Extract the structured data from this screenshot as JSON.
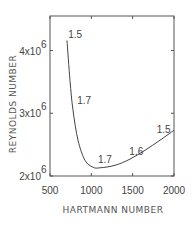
{
  "chart_data": {
    "type": "line",
    "title": "",
    "xlabel": "HARTMANN NUMBER",
    "ylabel": "REYNOLDS NUMBER",
    "xlim": [
      500,
      2000
    ],
    "ylim": [
      2000000,
      4550000
    ],
    "grid": false,
    "legend": null,
    "x_ticks": [
      500,
      1000,
      1500,
      2000
    ],
    "x_tick_labels": [
      "500",
      "1000",
      "1500",
      "2000"
    ],
    "y_ticks": [
      2000000,
      3000000,
      4000000
    ],
    "y_tick_labels": [
      {
        "base": "2x10",
        "exp": "6"
      },
      {
        "base": "3x10",
        "exp": "6"
      },
      {
        "base": "4x10",
        "exp": "6"
      }
    ],
    "series": [
      {
        "name": "critical Reynolds number",
        "x": [
          706,
          742,
          778,
          839,
          923,
          1020,
          1105,
          1286,
          1468,
          1649,
          1831,
          2000
        ],
        "y": [
          4160000,
          3520000,
          3050000,
          2570000,
          2250000,
          2140000,
          2130000,
          2170000,
          2270000,
          2410000,
          2570000,
          2730000
        ]
      }
    ],
    "annotations": [
      {
        "text": "1.5",
        "x": 720,
        "y": 4200000
      },
      {
        "text": "1.7",
        "x": 830,
        "y": 3150000
      },
      {
        "text": "1.7",
        "x": 1080,
        "y": 2200000
      },
      {
        "text": "1.6",
        "x": 1460,
        "y": 2330000
      },
      {
        "text": "1.5",
        "x": 1790,
        "y": 2690000
      }
    ]
  }
}
